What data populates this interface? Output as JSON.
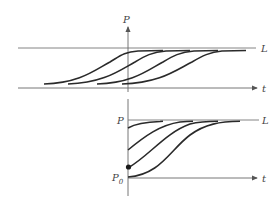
{
  "figure": {
    "top_panel": {
      "y_axis_label": "P",
      "x_axis_label": "t",
      "asymptote_label": "L",
      "curve_count": 4,
      "description": "Four shifted logistic curves approaching carrying capacity L"
    },
    "bottom_panel": {
      "y_axis_label": "P",
      "x_axis_label": "t",
      "asymptote_label": "L",
      "initial_label": "P",
      "initial_subscript": "0",
      "curve_count": 4,
      "description": "Logistic curves starting at different initial values approaching L"
    },
    "colors": {
      "axis": "#555555",
      "curve": "#2a2a2a",
      "label": "#444444"
    }
  }
}
